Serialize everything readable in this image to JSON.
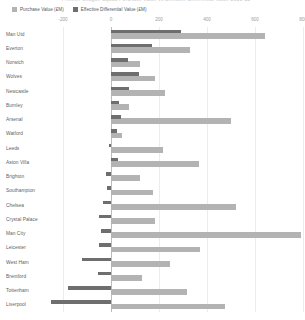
{
  "title": "Premier League Squad Purchase Value vs Effective Differential Value 2021-22",
  "legend": {
    "position": "top-left",
    "entries": [
      {
        "label": "Purchase Value (£M)",
        "color": "#b3b3b3",
        "icon": "legend-swatch"
      },
      {
        "label": "Effective Differential Value (£M)",
        "color": "#6e6e6e",
        "icon": "legend-swatch"
      }
    ]
  },
  "axis": {
    "position": "top",
    "ticks": [
      "-200",
      "0",
      "200",
      "400",
      "600",
      "800"
    ],
    "tick_values": [
      -200,
      0,
      200,
      400,
      600,
      800
    ],
    "xlim": [
      -300,
      800
    ],
    "grid": true
  },
  "colors": {
    "purchase": "#b3b3b3",
    "differential": "#6e6e6e",
    "grid": "#ececec",
    "axis": "#bcbcbc",
    "label_text": "#5c5f63",
    "tick_text": "#9b9da0"
  },
  "chart_data": {
    "type": "bar",
    "orientation": "horizontal",
    "title": "Premier League Squad Purchase Value vs Effective Differential Value 2021-22",
    "xlabel": "",
    "ylabel": "",
    "xlim": [
      -300,
      800
    ],
    "grid": true,
    "legend_position": "top-left",
    "categories": [
      "Man Utd",
      "Everton",
      "Norwich",
      "Wolves",
      "Newcastle",
      "Burnley",
      "Arsenal",
      "Watford",
      "Leeds",
      "Aston Villa",
      "Brighton",
      "Southampton",
      "Chelsea",
      "Crystal Palace",
      "Man City",
      "Leicester",
      "West Ham",
      "Brentford",
      "Tottenham",
      "Liverpool"
    ],
    "series": [
      {
        "name": "Purchase Value (£M)",
        "color": "#b3b3b3",
        "values": [
          640,
          330,
          120,
          185,
          225,
          75,
          500,
          45,
          215,
          365,
          120,
          175,
          520,
          185,
          790,
          370,
          245,
          130,
          315,
          475
        ]
      },
      {
        "name": "Effective Differential Value (£M)",
        "color": "#6e6e6e",
        "values": [
          290,
          170,
          70,
          115,
          75,
          35,
          40,
          25,
          -10,
          30,
          -20,
          -15,
          -35,
          -50,
          -40,
          -50,
          -120,
          -55,
          -180,
          -250
        ]
      }
    ]
  },
  "rows": [
    {
      "label": "Man Utd"
    },
    {
      "label": "Everton"
    },
    {
      "label": "Norwich"
    },
    {
      "label": "Wolves"
    },
    {
      "label": "Newcastle"
    },
    {
      "label": "Burnley"
    },
    {
      "label": "Arsenal"
    },
    {
      "label": "Watford"
    },
    {
      "label": "Leeds"
    },
    {
      "label": "Aston Villa"
    },
    {
      "label": "Brighton"
    },
    {
      "label": "Southampton"
    },
    {
      "label": "Chelsea"
    },
    {
      "label": "Crystal Palace"
    },
    {
      "label": "Man City"
    },
    {
      "label": "Leicester"
    },
    {
      "label": "West Ham"
    },
    {
      "label": "Brentford"
    },
    {
      "label": "Tottenham"
    },
    {
      "label": "Liverpool"
    }
  ]
}
